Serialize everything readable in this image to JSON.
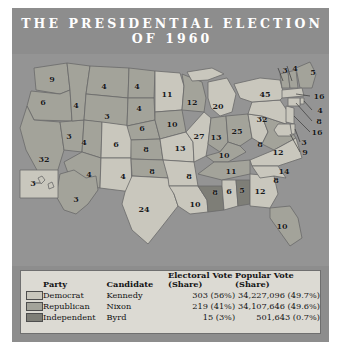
{
  "poster": {
    "title_line1": "THE PRESIDENTIAL ELECTION",
    "title_line2": "OF 1960"
  },
  "colors": {
    "democrat": "#c9c7bd",
    "republican": "#a3a39a",
    "independent": "#7e7e77",
    "poster_bg": "#8d8d8d",
    "map_bg": "#949494",
    "legend_bg": "#dcdad3",
    "border": "#5d5d5d",
    "title_text": "#ffffff"
  },
  "legend": {
    "headers": {
      "party": "Party",
      "candidate": "Candidate",
      "electoral_line1": "Electoral Vote",
      "electoral_line2": "(Share)",
      "popular_line1": "Popular Vote",
      "popular_line2": "(Share)"
    },
    "rows": [
      {
        "party": "Democrat",
        "candidate": "Kennedy",
        "electoral": "303 (56%)",
        "popular": "34,227,096 (49.7%)",
        "swatch": "democrat"
      },
      {
        "party": "Republican",
        "candidate": "Nixon",
        "electoral": "219 (41%)",
        "popular": "34,107,646 (49.6%)",
        "swatch": "republican"
      },
      {
        "party": "Independent",
        "candidate": "Byrd",
        "electoral": "15 (3%)",
        "popular": "501,643 (0.7%)",
        "swatch": "independent"
      }
    ]
  },
  "chart_data": {
    "type": "map",
    "title": "THE PRESIDENTIAL ELECTION OF 1960",
    "legend_position": "bottom",
    "categories": [
      "Democrat",
      "Republican",
      "Independent"
    ],
    "series": [
      {
        "name": "Electoral Vote",
        "values": [
          303,
          219,
          15
        ]
      },
      {
        "name": "Electoral Share",
        "values": [
          "56%",
          "41%",
          "3%"
        ]
      },
      {
        "name": "Popular Vote",
        "values": [
          34227096,
          34107646,
          501643
        ]
      },
      {
        "name": "Popular Share",
        "values": [
          "49.7%",
          "49.6%",
          "0.7%"
        ]
      }
    ],
    "states": [
      {
        "code": "WA",
        "electoral": 9,
        "party": "republican",
        "x": 40,
        "y": 25
      },
      {
        "code": "OR",
        "electoral": 6,
        "party": "republican",
        "x": 31,
        "y": 48
      },
      {
        "code": "CA",
        "electoral": 32,
        "party": "republican",
        "x": 32,
        "y": 105
      },
      {
        "code": "NV",
        "electoral": 3,
        "party": "republican",
        "x": 57,
        "y": 82
      },
      {
        "code": "ID",
        "electoral": 4,
        "party": "republican",
        "x": 64,
        "y": 51
      },
      {
        "code": "MT",
        "electoral": 4,
        "party": "republican",
        "x": 92,
        "y": 32
      },
      {
        "code": "WY",
        "electoral": 3,
        "party": "republican",
        "x": 95,
        "y": 62
      },
      {
        "code": "UT",
        "electoral": 4,
        "party": "republican",
        "x": 72,
        "y": 88
      },
      {
        "code": "CO",
        "electoral": 6,
        "party": "democrat",
        "x": 104,
        "y": 90
      },
      {
        "code": "AZ",
        "electoral": 4,
        "party": "republican",
        "x": 77,
        "y": 120
      },
      {
        "code": "NM",
        "electoral": 4,
        "party": "democrat",
        "x": 111,
        "y": 122
      },
      {
        "code": "ND",
        "electoral": 4,
        "party": "republican",
        "x": 125,
        "y": 32
      },
      {
        "code": "SD",
        "electoral": 4,
        "party": "republican",
        "x": 127,
        "y": 54
      },
      {
        "code": "NE",
        "electoral": 6,
        "party": "republican",
        "x": 130,
        "y": 74
      },
      {
        "code": "KS",
        "electoral": 8,
        "party": "republican",
        "x": 134,
        "y": 95
      },
      {
        "code": "OK",
        "electoral": 8,
        "party": "republican",
        "x": 140,
        "y": 117
      },
      {
        "code": "TX",
        "electoral": 24,
        "party": "democrat",
        "x": 132,
        "y": 155
      },
      {
        "code": "MN",
        "electoral": 11,
        "party": "democrat",
        "x": 155,
        "y": 40
      },
      {
        "code": "IA",
        "electoral": 10,
        "party": "republican",
        "x": 160,
        "y": 70
      },
      {
        "code": "MO",
        "electoral": 13,
        "party": "democrat",
        "x": 168,
        "y": 94
      },
      {
        "code": "AR",
        "electoral": 8,
        "party": "democrat",
        "x": 177,
        "y": 122
      },
      {
        "code": "LA",
        "electoral": 10,
        "party": "democrat",
        "x": 183,
        "y": 150
      },
      {
        "code": "WI",
        "electoral": 12,
        "party": "republican",
        "x": 180,
        "y": 48
      },
      {
        "code": "IL",
        "electoral": 27,
        "party": "democrat",
        "x": 187,
        "y": 82
      },
      {
        "code": "MS",
        "electoral": 8,
        "party": "independent",
        "x": 203,
        "y": 138
      },
      {
        "code": "MI",
        "electoral": 20,
        "party": "democrat",
        "x": 206,
        "y": 52
      },
      {
        "code": "IN",
        "electoral": 13,
        "party": "republican",
        "x": 204,
        "y": 83
      },
      {
        "code": "KY",
        "electoral": 10,
        "party": "republican",
        "x": 212,
        "y": 101
      },
      {
        "code": "TN",
        "electoral": 11,
        "party": "republican",
        "x": 219,
        "y": 117
      },
      {
        "code": "AL1",
        "electoral": 6,
        "party": "democrat",
        "x": 217,
        "y": 137
      },
      {
        "code": "AL2",
        "electoral": 5,
        "party": "independent",
        "x": 230,
        "y": 136
      },
      {
        "code": "OH",
        "electoral": 25,
        "party": "republican",
        "x": 225,
        "y": 77
      },
      {
        "code": "GA",
        "electoral": 12,
        "party": "democrat",
        "x": 248,
        "y": 137
      },
      {
        "code": "FL",
        "electoral": 10,
        "party": "republican",
        "x": 270,
        "y": 172
      },
      {
        "code": "WV",
        "electoral": 8,
        "party": "democrat",
        "x": 248,
        "y": 90
      },
      {
        "code": "VA",
        "electoral": 12,
        "party": "republican",
        "x": 266,
        "y": 98
      },
      {
        "code": "NC",
        "electoral": 14,
        "party": "democrat",
        "x": 272,
        "y": 117
      },
      {
        "code": "SC",
        "electoral": 8,
        "party": "democrat",
        "x": 264,
        "y": 126
      },
      {
        "code": "PA",
        "electoral": 32,
        "party": "democrat",
        "x": 250,
        "y": 65
      },
      {
        "code": "NY",
        "electoral": 45,
        "party": "democrat",
        "x": 253,
        "y": 40
      },
      {
        "code": "VT",
        "electoral": 3,
        "party": "republican",
        "x": 273,
        "y": 16
      },
      {
        "code": "NH",
        "electoral": 4,
        "party": "republican",
        "x": 283,
        "y": 14
      },
      {
        "code": "ME",
        "electoral": 5,
        "party": "republican",
        "x": 301,
        "y": 18
      },
      {
        "code": "MA",
        "electoral": 16,
        "party": "democrat",
        "x": 307,
        "y": 42
      },
      {
        "code": "RI",
        "electoral": 4,
        "party": "democrat",
        "x": 308,
        "y": 56
      },
      {
        "code": "CT",
        "electoral": 8,
        "party": "democrat",
        "x": 307,
        "y": 67
      },
      {
        "code": "NJ",
        "electoral": 16,
        "party": "democrat",
        "x": 305,
        "y": 78
      },
      {
        "code": "DE",
        "electoral": 3,
        "party": "democrat",
        "x": 292,
        "y": 88
      },
      {
        "code": "MD",
        "electoral": 9,
        "party": "democrat",
        "x": 293,
        "y": 98
      },
      {
        "code": "AK",
        "electoral": 3,
        "party": "republican",
        "x": 64,
        "y": 145
      },
      {
        "code": "HI",
        "electoral": 3,
        "party": "democrat",
        "x": 21,
        "y": 129
      }
    ]
  }
}
